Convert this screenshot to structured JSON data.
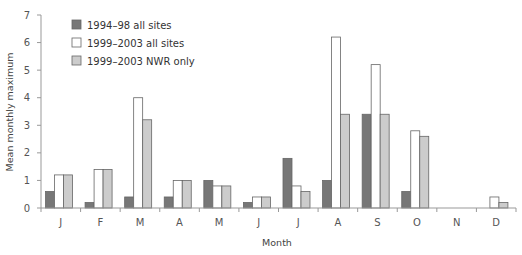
{
  "chart_data": {
    "type": "bar",
    "title": "",
    "xlabel": "Month",
    "ylabel": "Mean monthly maximum",
    "ylim": [
      0,
      7
    ],
    "yticks": [
      0,
      1,
      2,
      3,
      4,
      5,
      6,
      7
    ],
    "grid": false,
    "legend_position": "upper-left",
    "categories": [
      "J",
      "F",
      "M",
      "A",
      "M",
      "J",
      "J",
      "A",
      "S",
      "O",
      "N",
      "D"
    ],
    "series": [
      {
        "name": "1994–98 all sites",
        "color": "#777777",
        "values": [
          0.6,
          0.2,
          0.4,
          0.4,
          1.0,
          0.2,
          1.8,
          1.0,
          3.4,
          0.6,
          0,
          0
        ]
      },
      {
        "name": "1999–2003 all sites",
        "color": "#ffffff",
        "values": [
          1.2,
          1.4,
          4.0,
          1.0,
          0.8,
          0.4,
          0.8,
          6.2,
          5.2,
          2.8,
          0,
          0.4
        ]
      },
      {
        "name": "1999–2003 NWR only",
        "color": "#cccccc",
        "values": [
          1.2,
          1.4,
          3.2,
          1.0,
          0.8,
          0.4,
          0.6,
          3.4,
          3.4,
          2.6,
          0,
          0.2
        ]
      }
    ]
  }
}
